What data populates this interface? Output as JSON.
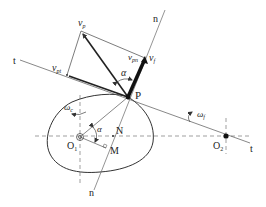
{
  "diagram": {
    "type": "cam-follower velocity diagram",
    "colors": {
      "line": "#333333",
      "thin_line": "#555555",
      "dashed": "#777777",
      "background": "#ffffff"
    },
    "labels": {
      "t_left": "t",
      "t_right": "t",
      "n_top": "n",
      "n_bottom": "n",
      "vp": "v",
      "vp_sub": "p",
      "vpt": "v",
      "vpt_sub": "pt",
      "vpn": "v",
      "vpn_sub": "pn",
      "vf": "v",
      "vf_sub": "f",
      "alpha_top": "α",
      "alpha_bottom": "α",
      "P": "P",
      "N": "N",
      "M": "M",
      "O1": "O",
      "O1_sub": "1",
      "O2": "O",
      "O2_sub": "2",
      "omega_c": "ω",
      "omega_c_sub": "c",
      "omega_f": "ω",
      "omega_f_sub": "f"
    },
    "points": {
      "P": [
        128,
        97
      ],
      "vp": [
        81,
        31
      ],
      "vpt": [
        67,
        75
      ],
      "vf": [
        145,
        58
      ],
      "O1": [
        80,
        137
      ],
      "O2": [
        226,
        136
      ],
      "N": [
        113,
        136
      ],
      "M": [
        106,
        148
      ]
    }
  }
}
